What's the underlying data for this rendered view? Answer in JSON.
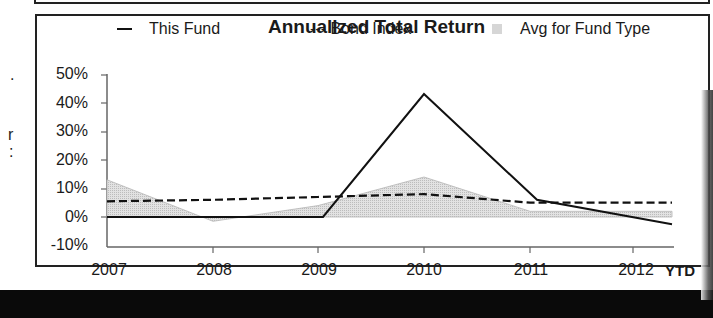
{
  "left_fragments": [
    ".",
    "r",
    ":"
  ],
  "chart": {
    "title": "Annualized Total Return",
    "legend": [
      {
        "label": "This Fund",
        "style": "solid-line"
      },
      {
        "label": "--- Bond Index",
        "style": "dashed-line"
      },
      {
        "label": "Avg for Fund Type",
        "style": "shaded-area"
      }
    ],
    "y_ticks": [
      "50%",
      "40%",
      "30%",
      "20%",
      "10%",
      "0%",
      "-10%"
    ],
    "x_ticks": [
      "2007",
      "2008",
      "2009",
      "2010",
      "2011",
      "2012"
    ],
    "x_suffix": "YTD"
  },
  "chart_data": {
    "type": "line",
    "title": "Annualized Total Return",
    "xlabel": "",
    "ylabel": "",
    "categories": [
      "2007",
      "2008",
      "2009",
      "2010",
      "2011",
      "2012 YTD"
    ],
    "ylim": [
      -10,
      50
    ],
    "y_ticks": [
      -10,
      0,
      10,
      20,
      30,
      40,
      50
    ],
    "grid": false,
    "legend_position": "top",
    "series": [
      {
        "name": "This Fund",
        "style": "solid",
        "values": [
          0,
          0,
          0,
          43,
          6,
          -2.5
        ]
      },
      {
        "name": "Bond Index",
        "style": "dashed",
        "values": [
          5.5,
          6,
          7,
          8,
          5,
          5
        ]
      },
      {
        "name": "Avg for Fund Type",
        "style": "area",
        "values": [
          13,
          -1.5,
          4,
          14,
          2,
          2
        ]
      }
    ]
  },
  "colors": {
    "line": "#111111",
    "area_fill": "#d4d4d4",
    "frame": "#222222",
    "background": "#ffffff"
  }
}
